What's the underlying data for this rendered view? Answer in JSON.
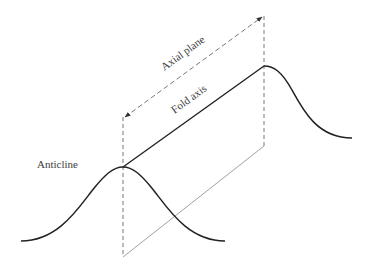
{
  "diagram": {
    "labels": {
      "anticline": "Anticline",
      "axial_plane": "Axial plane",
      "fold_axis": "Fold axis"
    },
    "colors": {
      "stroke": "#222222",
      "dashed": "#777777",
      "thin": "#888888",
      "text": "#3a3a3a",
      "background": "#ffffff"
    }
  }
}
